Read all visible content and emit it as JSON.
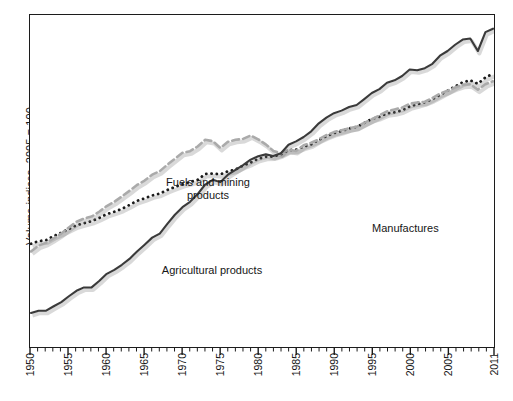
{
  "chart_data": {
    "type": "line",
    "title": "",
    "subtitle": "",
    "xlabel": "",
    "ylabel": "Volume indices, 2005 = 100",
    "grid": false,
    "legend_position": "inline-annotations",
    "yscale": "log",
    "xlim": [
      1950,
      2011
    ],
    "ylim": [
      2,
      160
    ],
    "xticks": [
      1950,
      1955,
      1960,
      1965,
      1970,
      1975,
      1980,
      1985,
      1990,
      1995,
      2000,
      2005,
      2011
    ],
    "xtick_labels": [
      "1950",
      "1955",
      "1960",
      "1965",
      "1970",
      "1975",
      "1980",
      "1985",
      "1990",
      "1995",
      "2000",
      "2005",
      "2011"
    ],
    "minor_tick_interval": 1,
    "ytick_labels": [],
    "x": [
      1950,
      1951,
      1952,
      1953,
      1954,
      1955,
      1956,
      1957,
      1958,
      1959,
      1960,
      1961,
      1962,
      1963,
      1964,
      1965,
      1966,
      1967,
      1968,
      1969,
      1970,
      1971,
      1972,
      1973,
      1974,
      1975,
      1976,
      1977,
      1978,
      1979,
      1980,
      1981,
      1982,
      1983,
      1984,
      1985,
      1986,
      1987,
      1988,
      1989,
      1990,
      1991,
      1992,
      1993,
      1994,
      1995,
      1996,
      1997,
      1998,
      1999,
      2000,
      2001,
      2002,
      2003,
      2004,
      2005,
      2006,
      2007,
      2008,
      2009,
      2010,
      2011
    ],
    "series": [
      {
        "name": "Agricultural products",
        "style": "dotted",
        "color": "#1c1c1c",
        "values": [
          8.0,
          8.3,
          8.4,
          8.9,
          9.3,
          9.8,
          10.3,
          10.6,
          10.9,
          11.4,
          12.0,
          12.4,
          12.9,
          13.6,
          14.4,
          14.9,
          15.5,
          15.9,
          16.7,
          17.4,
          18.1,
          18.6,
          19.2,
          20.8,
          20.9,
          20.7,
          21.6,
          22.1,
          23.3,
          24.3,
          25.6,
          26.3,
          26.4,
          27.2,
          28.8,
          29.0,
          30.2,
          31.2,
          33.2,
          34.9,
          36.4,
          37.4,
          38.8,
          39.6,
          41.8,
          44.2,
          45.5,
          47.7,
          48.4,
          49.7,
          52.4,
          54.0,
          55.6,
          58.0,
          61.4,
          65.0,
          69.0,
          73.0,
          75.0,
          71.5,
          78.0,
          82.0
        ]
      },
      {
        "name": "Fuels and mining products",
        "style": "dashed",
        "color": "#aaaaaa",
        "values": [
          7.2,
          7.8,
          8.1,
          8.6,
          9.2,
          10.0,
          10.8,
          11.3,
          11.6,
          12.4,
          13.4,
          14.2,
          15.3,
          16.5,
          17.9,
          19.0,
          20.6,
          21.6,
          23.6,
          25.6,
          27.8,
          28.4,
          30.3,
          33.2,
          32.6,
          29.7,
          32.3,
          33.2,
          33.6,
          35.2,
          33.4,
          31.2,
          28.5,
          27.6,
          29.0,
          28.5,
          30.8,
          31.9,
          33.4,
          35.4,
          36.9,
          37.9,
          38.9,
          39.7,
          41.9,
          44.0,
          46.4,
          49.0,
          50.3,
          51.6,
          54.4,
          55.4,
          55.9,
          58.8,
          62.5,
          65.0,
          68.0,
          70.5,
          71.0,
          66.0,
          71.0,
          74.0
        ]
      },
      {
        "name": "Manufactures",
        "style": "solid",
        "color": "#3a3a3a",
        "values": [
          3.1,
          3.2,
          3.2,
          3.4,
          3.6,
          3.9,
          4.2,
          4.4,
          4.4,
          4.8,
          5.3,
          5.6,
          6.0,
          6.5,
          7.2,
          7.9,
          8.7,
          9.2,
          10.5,
          11.9,
          13.2,
          14.2,
          15.8,
          18.0,
          19.2,
          18.6,
          20.6,
          22.0,
          23.5,
          25.3,
          26.5,
          27.2,
          26.6,
          27.6,
          31.0,
          32.5,
          34.5,
          37.3,
          41.6,
          45.0,
          47.8,
          49.5,
          52.0,
          53.5,
          58.0,
          63.0,
          66.5,
          72.5,
          75.0,
          79.5,
          87.0,
          86.0,
          88.5,
          94.0,
          105.0,
          112.0,
          122.0,
          131.0,
          133.0,
          112.0,
          145.0,
          152.0
        ]
      }
    ],
    "annotations": [
      {
        "name": "Fuels and mining products",
        "text": "Fuels and mining\nproducts"
      },
      {
        "name": "Agricultural products",
        "text": "Agricultural products"
      },
      {
        "name": "Manufactures",
        "text": "Manufactures"
      }
    ]
  },
  "axis": {
    "y_title": "Volume indices, 2005 = 100",
    "x_labels": [
      "1950",
      "1955",
      "1960",
      "1965",
      "1970",
      "1975",
      "1980",
      "1985",
      "1990",
      "1995",
      "2000",
      "2005",
      "2011"
    ]
  },
  "annotations": {
    "fuels": "Fuels and mining\nproducts",
    "agricultural": "Agricultural products",
    "manufactures": "Manufactures"
  },
  "colors": {
    "axis": "#1c1c1c",
    "manufactures": "#3a3a3a",
    "agricultural": "#1c1c1c",
    "fuels": "#aaaaaa",
    "background": "#ffffff"
  }
}
